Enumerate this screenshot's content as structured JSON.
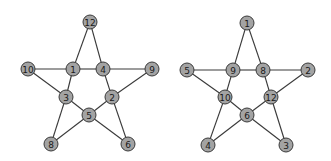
{
  "graphs": [
    {
      "name": "left-star",
      "nodes": [
        {
          "id": "12",
          "x": 90,
          "y": 22
        },
        {
          "id": "10",
          "x": 28,
          "y": 69
        },
        {
          "id": "1",
          "x": 73,
          "y": 69
        },
        {
          "id": "4",
          "x": 103,
          "y": 69
        },
        {
          "id": "9",
          "x": 152,
          "y": 69
        },
        {
          "id": "3",
          "x": 66,
          "y": 97
        },
        {
          "id": "2",
          "x": 112,
          "y": 97
        },
        {
          "id": "5",
          "x": 89,
          "y": 115
        },
        {
          "id": "8",
          "x": 51,
          "y": 144
        },
        {
          "id": "6",
          "x": 128,
          "y": 144
        }
      ],
      "edges": [
        [
          "12",
          "1"
        ],
        [
          "12",
          "4"
        ],
        [
          "10",
          "1"
        ],
        [
          "1",
          "4"
        ],
        [
          "4",
          "9"
        ],
        [
          "10",
          "3"
        ],
        [
          "1",
          "3"
        ],
        [
          "9",
          "2"
        ],
        [
          "4",
          "2"
        ],
        [
          "3",
          "5"
        ],
        [
          "2",
          "5"
        ],
        [
          "3",
          "8"
        ],
        [
          "8",
          "5"
        ],
        [
          "5",
          "6"
        ],
        [
          "2",
          "6"
        ]
      ]
    },
    {
      "name": "right-star",
      "nodes": [
        {
          "id": "1",
          "x": 247,
          "y": 23
        },
        {
          "id": "5",
          "x": 187,
          "y": 70
        },
        {
          "id": "9",
          "x": 233,
          "y": 70
        },
        {
          "id": "8",
          "x": 263,
          "y": 70
        },
        {
          "id": "2",
          "x": 308,
          "y": 70
        },
        {
          "id": "10",
          "x": 225,
          "y": 97
        },
        {
          "id": "12",
          "x": 271,
          "y": 97
        },
        {
          "id": "6",
          "x": 247,
          "y": 115
        },
        {
          "id": "4",
          "x": 208,
          "y": 145
        },
        {
          "id": "3",
          "x": 286,
          "y": 145
        }
      ],
      "edges": [
        [
          "1",
          "9"
        ],
        [
          "1",
          "8"
        ],
        [
          "5",
          "9"
        ],
        [
          "9",
          "8"
        ],
        [
          "8",
          "2"
        ],
        [
          "5",
          "10"
        ],
        [
          "9",
          "10"
        ],
        [
          "2",
          "12"
        ],
        [
          "8",
          "12"
        ],
        [
          "10",
          "6"
        ],
        [
          "12",
          "6"
        ],
        [
          "10",
          "4"
        ],
        [
          "4",
          "6"
        ],
        [
          "6",
          "3"
        ],
        [
          "12",
          "3"
        ]
      ]
    }
  ],
  "style": {
    "node_fill": "#a3a3a3",
    "node_stroke": "#3a3a3a",
    "edge_color": "#3a3a3a",
    "node_radius": 7
  }
}
